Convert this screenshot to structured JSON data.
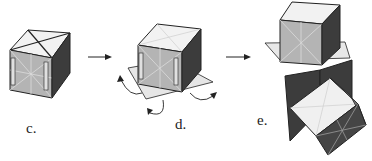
{
  "figure": {
    "panels": [
      {
        "id": "c",
        "label": "c."
      },
      {
        "id": "d",
        "label": "d."
      },
      {
        "id": "e",
        "label": "e."
      }
    ],
    "colors": {
      "front_face": "#b4b4b4",
      "side_face": "#3c3c3c",
      "top_face": "#f2f2f2",
      "dark_face": "#454545",
      "stroke": "#222222"
    }
  }
}
